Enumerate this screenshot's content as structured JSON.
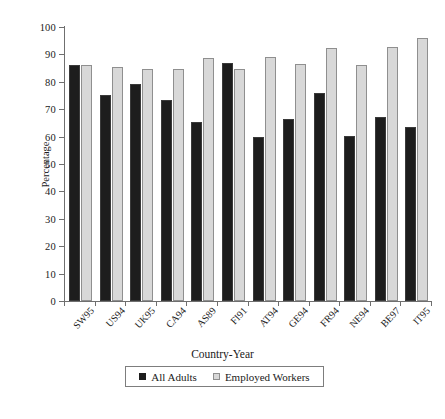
{
  "figure": {
    "y_axis_title": "Percentage",
    "x_axis_title": "Country-Year",
    "rule_top": "horizontal-rule",
    "rule_bottom": "horizontal-rule"
  },
  "legend": {
    "position": "bottom-center",
    "entries": [
      {
        "label": "All Adults",
        "swatch": "dark-square-icon",
        "color": "#1d1d1d"
      },
      {
        "label": "Employed Workers",
        "swatch": "light-square-icon",
        "color": "#d8d8d8"
      }
    ]
  },
  "chart_data": {
    "type": "bar",
    "title": "",
    "subtitle": "",
    "xlabel": "Country-Year",
    "ylabel": "Percentage",
    "ylim": [
      0,
      100
    ],
    "ytick_step": 10,
    "yticks": [
      0,
      10,
      20,
      30,
      40,
      50,
      60,
      70,
      80,
      90,
      100
    ],
    "ytick_labels": [
      "0",
      "10",
      "20",
      "30",
      "40",
      "50",
      "60",
      "70",
      "80",
      "90",
      "100"
    ],
    "grid": false,
    "legend_position": "bottom",
    "categories": [
      "SW95",
      "US94",
      "UK95",
      "CA94",
      "AS89",
      "FI91",
      "AT94",
      "GE94",
      "FR94",
      "NE94",
      "BE97",
      "IT95"
    ],
    "series": [
      {
        "name": "All Adults",
        "color": "#1d1d1d",
        "values": [
          86,
          75,
          79.3,
          73.5,
          65.4,
          87,
          59.8,
          66.5,
          75.8,
          60.1,
          67,
          63.4
        ]
      },
      {
        "name": "Employed Workers",
        "color": "#d8d8d8",
        "values": [
          86,
          85.4,
          84.7,
          84.7,
          88.8,
          84.7,
          88.9,
          86.6,
          92.4,
          86.1,
          92.8,
          96
        ]
      }
    ]
  }
}
